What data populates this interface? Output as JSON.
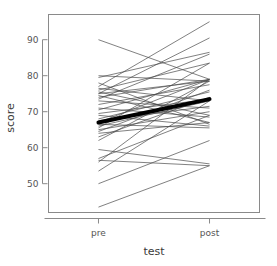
{
  "chart_data": {
    "type": "line",
    "title": "",
    "xlabel": "test",
    "ylabel": "score",
    "categories": [
      "pre",
      "post"
    ],
    "x": [
      1,
      2
    ],
    "xlim": [
      0.55,
      2.45
    ],
    "ylim": [
      42,
      97
    ],
    "yticks": [
      50,
      60,
      70,
      80,
      90
    ],
    "ytick_labels": [
      "50",
      "60",
      "70",
      "80",
      "90"
    ],
    "xtick_labels": [
      "pre",
      "post"
    ],
    "grid": false,
    "legend": null,
    "series": [
      {
        "name": "subject-01",
        "values": [
          90.0,
          79.0
        ],
        "style": "thin"
      },
      {
        "name": "subject-02",
        "values": [
          80.0,
          78.5
        ],
        "style": "thin"
      },
      {
        "name": "subject-03",
        "values": [
          79.5,
          86.5
        ],
        "style": "thin"
      },
      {
        "name": "subject-04",
        "values": [
          78.0,
          66.5
        ],
        "style": "thin"
      },
      {
        "name": "subject-05",
        "values": [
          77.0,
          95.0
        ],
        "style": "thin"
      },
      {
        "name": "subject-06",
        "values": [
          76.5,
          73.0
        ],
        "style": "thin"
      },
      {
        "name": "subject-07",
        "values": [
          76.0,
          83.5
        ],
        "style": "thin"
      },
      {
        "name": "subject-08",
        "values": [
          75.5,
          69.0
        ],
        "style": "thin"
      },
      {
        "name": "subject-09",
        "values": [
          75.0,
          90.5
        ],
        "style": "thin"
      },
      {
        "name": "subject-10",
        "values": [
          75.0,
          78.5
        ],
        "style": "thin"
      },
      {
        "name": "subject-11",
        "values": [
          74.5,
          67.0
        ],
        "style": "thin"
      },
      {
        "name": "subject-12",
        "values": [
          74.0,
          79.0
        ],
        "style": "thin"
      },
      {
        "name": "subject-13",
        "values": [
          73.5,
          86.0
        ],
        "style": "thin"
      },
      {
        "name": "subject-14",
        "values": [
          73.0,
          71.0
        ],
        "style": "thin"
      },
      {
        "name": "subject-15",
        "values": [
          72.0,
          77.5
        ],
        "style": "thin"
      },
      {
        "name": "subject-16",
        "values": [
          71.0,
          68.5
        ],
        "style": "thin"
      },
      {
        "name": "subject-17",
        "values": [
          70.5,
          79.0
        ],
        "style": "thin"
      },
      {
        "name": "subject-18",
        "values": [
          69.5,
          73.5
        ],
        "style": "thin"
      },
      {
        "name": "subject-19",
        "values": [
          69.0,
          66.0
        ],
        "style": "thin"
      },
      {
        "name": "subject-20",
        "values": [
          68.0,
          75.5
        ],
        "style": "thin"
      },
      {
        "name": "subject-21",
        "values": [
          67.5,
          71.5
        ],
        "style": "thin"
      },
      {
        "name": "subject-22",
        "values": [
          67.0,
          79.0
        ],
        "style": "thin"
      },
      {
        "name": "subject-23",
        "values": [
          66.5,
          65.5
        ],
        "style": "thin"
      },
      {
        "name": "subject-24",
        "values": [
          66.0,
          73.0
        ],
        "style": "thin"
      },
      {
        "name": "subject-25",
        "values": [
          65.5,
          83.5
        ],
        "style": "thin"
      },
      {
        "name": "subject-26",
        "values": [
          65.0,
          70.0
        ],
        "style": "thin"
      },
      {
        "name": "subject-27",
        "values": [
          64.5,
          76.0
        ],
        "style": "thin"
      },
      {
        "name": "subject-28",
        "values": [
          64.0,
          67.0
        ],
        "style": "thin"
      },
      {
        "name": "subject-29",
        "values": [
          63.0,
          74.0
        ],
        "style": "thin"
      },
      {
        "name": "subject-30",
        "values": [
          62.0,
          78.5
        ],
        "style": "thin"
      },
      {
        "name": "subject-31",
        "values": [
          59.5,
          55.5
        ],
        "style": "thin"
      },
      {
        "name": "subject-32",
        "values": [
          57.0,
          69.0
        ],
        "style": "thin"
      },
      {
        "name": "subject-33",
        "values": [
          56.5,
          55.0
        ],
        "style": "thin"
      },
      {
        "name": "subject-34",
        "values": [
          56.0,
          79.0
        ],
        "style": "thin"
      },
      {
        "name": "subject-35",
        "values": [
          53.5,
          73.0
        ],
        "style": "thin"
      },
      {
        "name": "subject-36",
        "values": [
          50.0,
          62.0
        ],
        "style": "thin"
      },
      {
        "name": "subject-37",
        "values": [
          43.5,
          55.0
        ],
        "style": "thin"
      },
      {
        "name": "mean",
        "values": [
          67.0,
          73.5
        ],
        "style": "bold"
      }
    ]
  },
  "colors": {
    "line": "#4a4a4a",
    "mean_line": "#000000",
    "axis": "#8a8a8a",
    "frame": "#8a8a8a",
    "text": "#555555",
    "background": "#ffffff"
  }
}
